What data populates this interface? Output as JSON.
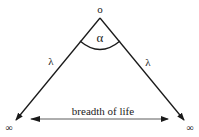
{
  "diagram": {
    "apex_label": "o",
    "angle_label": "α",
    "left_side_label": "λ",
    "right_side_label": "λ",
    "left_end_label": "∞",
    "right_end_label": "∞",
    "base_label": "breadth of life",
    "colors": {
      "line": "#1a1a1a",
      "base_arrow": "#333333",
      "background": "#ffffff"
    }
  }
}
